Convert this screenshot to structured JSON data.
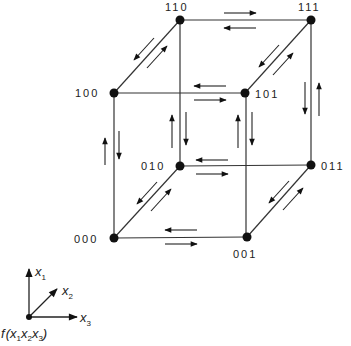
{
  "diagram": {
    "nodes": [
      {
        "id": "000",
        "label": "000"
      },
      {
        "id": "001",
        "label": "001"
      },
      {
        "id": "010",
        "label": "010"
      },
      {
        "id": "011",
        "label": "011"
      },
      {
        "id": "100",
        "label": "100"
      },
      {
        "id": "101",
        "label": "101"
      },
      {
        "id": "110",
        "label": "110"
      },
      {
        "id": "111",
        "label": "111"
      }
    ],
    "edges": [
      {
        "from": "000",
        "to": "001",
        "arrows": "bidirectional"
      },
      {
        "from": "010",
        "to": "011",
        "arrows": "bidirectional"
      },
      {
        "from": "100",
        "to": "101",
        "arrows": "bidirectional"
      },
      {
        "from": "110",
        "to": "111",
        "arrows": "bidirectional"
      },
      {
        "from": "000",
        "to": "100",
        "arrows": "bidirectional"
      },
      {
        "from": "010",
        "to": "110",
        "arrows": "bidirectional"
      },
      {
        "from": "001",
        "to": "101",
        "arrows": "bidirectional"
      },
      {
        "from": "011",
        "to": "111",
        "arrows": "bidirectional"
      },
      {
        "from": "000",
        "to": "010",
        "arrows": "bidirectional"
      },
      {
        "from": "001",
        "to": "011",
        "arrows": "bidirectional"
      },
      {
        "from": "100",
        "to": "110",
        "arrows": "bidirectional"
      },
      {
        "from": "101",
        "to": "111",
        "arrows": "bidirectional"
      }
    ],
    "axes": {
      "x1": "x",
      "x1_sub": "1",
      "x2": "x",
      "x2_sub": "2",
      "x3": "x",
      "x3_sub": "3",
      "function_label": "f(x1x2x3)",
      "f": "f",
      "open_paren": "(",
      "close_paren": ")"
    }
  }
}
